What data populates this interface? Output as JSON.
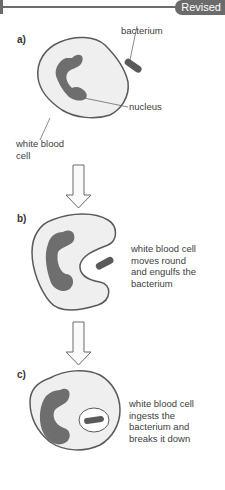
{
  "header": {
    "badge": "Revised"
  },
  "panels": [
    {
      "step": "a)",
      "labels": {
        "bacterium": "bacterium",
        "nucleus": "nucleus",
        "cell_line1": "white blood",
        "cell_line2": "cell"
      }
    },
    {
      "step": "b)",
      "caption": [
        "white blood cell",
        "moves round",
        "and engulfs the",
        "bacterium"
      ]
    },
    {
      "step": "c)",
      "caption": [
        "white blood cell",
        "ingests the",
        "bacterium and",
        "breaks it down"
      ]
    }
  ],
  "colors": {
    "cell_fill": "#efefef",
    "cell_outline": "#5a5a5a",
    "nucleus": "#6e6e6e",
    "bacterium": "#5a5a5a",
    "badge": "#6b6b6b"
  }
}
